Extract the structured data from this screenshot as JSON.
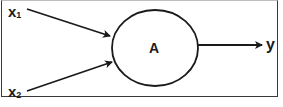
{
  "diagram": {
    "type": "single-node neuron/flow diagram",
    "inputs": [
      {
        "id": "x1",
        "label": "x",
        "subscript": "1"
      },
      {
        "id": "x2",
        "label": "x",
        "subscript": "2"
      }
    ],
    "node": {
      "label": "A"
    },
    "output": {
      "label": "y"
    },
    "edges": [
      {
        "from": "x1",
        "to": "A"
      },
      {
        "from": "x2",
        "to": "A"
      },
      {
        "from": "A",
        "to": "y"
      }
    ],
    "caption_cut_off": "..."
  },
  "colors": {
    "stroke": "#1a1a1a",
    "background": "#ffffff",
    "frame": "#3a3a3a"
  }
}
